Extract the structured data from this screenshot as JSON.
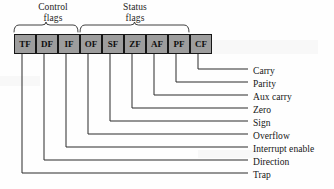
{
  "figure": {
    "background_color": "#fefefe",
    "box_fill_color": "#9d9d9d",
    "box_border_color": "#171717",
    "line_color": "#2a2a2a"
  },
  "groups": [
    {
      "id": "control",
      "label": "Control\nflags",
      "label_x": 22,
      "label_y": 2,
      "label_width": 62,
      "brace_start": 14,
      "brace_end": 78
    },
    {
      "id": "status",
      "label": "Status\nflags",
      "label_x": 104,
      "label_y": 2,
      "label_width": 62,
      "brace_start": 80,
      "brace_end": 189
    }
  ],
  "flags": [
    {
      "abbr": "TF",
      "name": "Trap",
      "x": 14,
      "width": 22,
      "center": 25,
      "label_y": 176,
      "elbow_y": 173
    },
    {
      "abbr": "DF",
      "name": "Direction",
      "x": 36,
      "width": 22,
      "center": 47,
      "label_y": 163,
      "elbow_y": 160
    },
    {
      "abbr": "IF",
      "name": "Interrupt enable",
      "x": 58,
      "width": 22,
      "center": 69,
      "label_y": 150,
      "elbow_y": 147
    },
    {
      "abbr": "OF",
      "name": "Overflow",
      "x": 80,
      "width": 22,
      "center": 91,
      "label_y": 137,
      "elbow_y": 134
    },
    {
      "abbr": "SF",
      "name": "Sign",
      "x": 102,
      "width": 22,
      "center": 113,
      "label_y": 124,
      "elbow_y": 121
    },
    {
      "abbr": "ZF",
      "name": "Zero",
      "x": 124,
      "width": 22,
      "center": 135,
      "label_y": 111,
      "elbow_y": 108
    },
    {
      "abbr": "AF",
      "name": "Aux carry",
      "x": 146,
      "width": 22,
      "center": 157,
      "label_y": 98,
      "elbow_y": 95
    },
    {
      "abbr": "PF",
      "name": "Parity",
      "x": 168,
      "width": 22,
      "center": 179,
      "label_y": 85,
      "elbow_y": 82
    },
    {
      "abbr": "CF",
      "name": "Carry",
      "x": 190,
      "width": 22,
      "center": 201,
      "label_y": 72,
      "elbow_y": 69
    }
  ],
  "leader_line": {
    "label_x": 253,
    "horizontal_end_x": 248,
    "box_bottom_y": 54
  }
}
